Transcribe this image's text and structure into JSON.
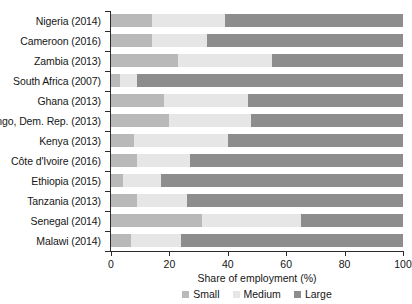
{
  "chart_data": {
    "type": "bar",
    "orientation": "horizontal",
    "stacked": true,
    "title": "",
    "xlabel": "Share of employment (%)",
    "ylabel": "",
    "xlim": [
      0,
      100
    ],
    "xticks": [
      0,
      20,
      40,
      60,
      80,
      100
    ],
    "grid": false,
    "legend_position": "bottom",
    "categories": [
      "Nigeria (2014)",
      "Cameroon (2016)",
      "Zambia (2013)",
      "South Africa (2007)",
      "Ghana (2013)",
      "Congo, Dem. Rep. (2013)",
      "Kenya (2013)",
      "Côte d'Ivoire (2016)",
      "Ethiopia (2015)",
      "Tanzania (2013)",
      "Senegal (2014)",
      "Malawi (2014)"
    ],
    "series": [
      {
        "name": "Small",
        "color": "#b9b9b9",
        "values": [
          14,
          14,
          23,
          3,
          18,
          20,
          8,
          9,
          4,
          9,
          31,
          7
        ]
      },
      {
        "name": "Medium",
        "color": "#e6e6e6",
        "values": [
          25,
          19,
          32,
          6,
          29,
          28,
          32,
          18,
          13,
          17,
          34,
          17
        ]
      },
      {
        "name": "Large",
        "color": "#8d8d8d",
        "values": [
          61,
          67,
          45,
          91,
          53,
          52,
          60,
          73,
          83,
          74,
          35,
          76
        ]
      }
    ]
  }
}
